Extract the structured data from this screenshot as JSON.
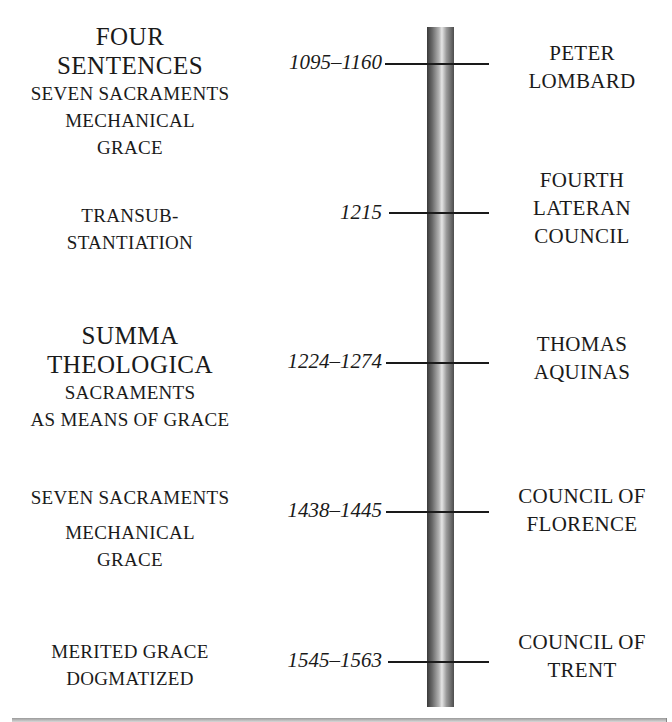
{
  "timeline": {
    "events": [
      {
        "date": "1095–1160",
        "event": [
          "PETER",
          "LOMBARD"
        ],
        "left": {
          "big": [
            "FOUR",
            "SENTENCES"
          ],
          "small": [
            "SEVEN SACRAMENTS",
            "MECHANICAL",
            "GRACE"
          ]
        }
      },
      {
        "date": "1215",
        "event": [
          "FOURTH",
          "LATERAN",
          "COUNCIL"
        ],
        "left": {
          "big": [],
          "small": [
            "TRANSUB-",
            "STANTIATION"
          ]
        }
      },
      {
        "date": "1224–1274",
        "event": [
          "THOMAS",
          "AQUINAS"
        ],
        "left": {
          "big": [
            "SUMMA",
            "THEOLOGICA"
          ],
          "small": [
            "SACRAMENTS",
            "AS MEANS OF GRACE"
          ]
        }
      },
      {
        "date": "1438–1445",
        "event": [
          "COUNCIL OF",
          "FLORENCE"
        ],
        "left": {
          "big": [],
          "small": [
            "SEVEN SACRAMENTS",
            "MECHANICAL",
            "GRACE"
          ]
        }
      },
      {
        "date": "1545–1563",
        "event": [
          "COUNCIL OF",
          "TRENT"
        ],
        "left": {
          "big": [],
          "small": [
            "MERITED GRACE",
            "DOGMATIZED"
          ]
        }
      }
    ]
  },
  "colors": {
    "text": "#1a1a1a",
    "pole_dark": "#3a3a3a",
    "pole_light": "#e6e6e6",
    "background": "#ffffff"
  }
}
